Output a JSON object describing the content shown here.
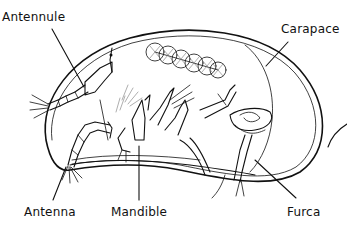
{
  "diagram": {
    "stroke_color": "#111111",
    "background": "#ffffff",
    "labels": [
      {
        "id": "antennule",
        "text": "Antennule",
        "x": 2,
        "y": 10
      },
      {
        "id": "carapace",
        "text": "Carapace",
        "x": 281,
        "y": 22
      },
      {
        "id": "antenna",
        "text": "Antenna",
        "x": 24,
        "y": 206
      },
      {
        "id": "mandible",
        "text": "Mandible",
        "x": 111,
        "y": 206
      },
      {
        "id": "furca",
        "text": "Furca",
        "x": 287,
        "y": 206
      }
    ],
    "leader_lines": [
      {
        "label": "antennule",
        "from": [
          52,
          29
        ],
        "to": [
          84,
          87
        ]
      },
      {
        "label": "carapace",
        "from": [
          288,
          42
        ],
        "to": [
          266,
          66
        ]
      },
      {
        "label": "antenna",
        "from": [
          53,
          200
        ],
        "to": [
          66,
          167
        ]
      },
      {
        "label": "mandible",
        "from": [
          139,
          200
        ],
        "to": [
          139,
          146
        ]
      },
      {
        "label": "furca",
        "from": [
          296,
          198
        ],
        "to": [
          255,
          160
        ]
      }
    ]
  }
}
